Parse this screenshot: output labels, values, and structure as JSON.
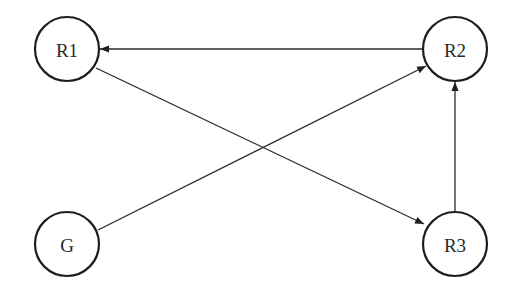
{
  "diagram": {
    "type": "directed-graph",
    "nodes": [
      {
        "id": "R1",
        "label": "R1",
        "cx": 67,
        "cy": 49,
        "r": 32
      },
      {
        "id": "R2",
        "label": "R2",
        "cx": 455,
        "cy": 49,
        "r": 32
      },
      {
        "id": "G",
        "label": "G",
        "cx": 67,
        "cy": 244,
        "r": 32
      },
      {
        "id": "R3",
        "label": "R3",
        "cx": 455,
        "cy": 244,
        "r": 32
      }
    ],
    "edges": [
      {
        "from": "R2",
        "to": "R1"
      },
      {
        "from": "R1",
        "to": "R3"
      },
      {
        "from": "G",
        "to": "R2"
      },
      {
        "from": "R3",
        "to": "R2"
      }
    ],
    "colors": {
      "stroke": "#1e1e1e",
      "edge": "#2a2a2a",
      "background": "#ffffff"
    }
  }
}
